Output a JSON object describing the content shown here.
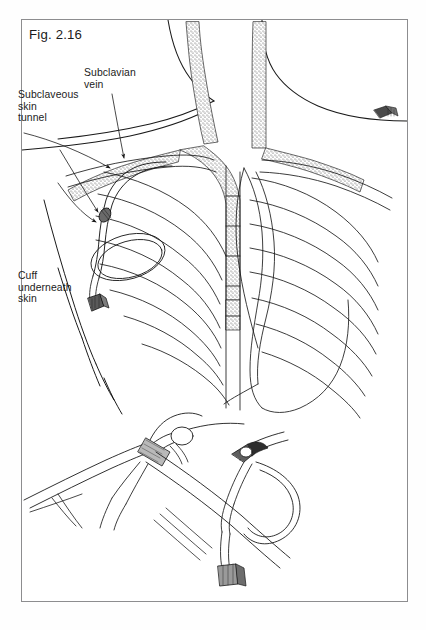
{
  "figure": {
    "number": "Fig. 2.16",
    "frame": {
      "border_color": "#8d8d8f",
      "background": "#ffffff"
    },
    "ink_color": "#1a1a1a",
    "stipple_color": "#555555"
  },
  "labels": [
    {
      "id": "subclavian-vein",
      "text": "Subclavian\nvein"
    },
    {
      "id": "subclaveous-skin-tunnel",
      "text": "Subclaveous\nskin\ntunnel"
    },
    {
      "id": "cuff-underneath-skin",
      "text": "Cuff\nunderneath\nskin"
    }
  ],
  "anatomy": {
    "main_view": "anterior chest and neck with rib cage, sternum, heart silhouette and stippled subclavian and jugular veins",
    "structures": [
      "neck contour",
      "clavicle",
      "rib cage",
      "sternum",
      "heart outline",
      "subclavian vein (stippled)",
      "internal jugular veins (stippled)",
      "tunneled catheter",
      "catheter cuff",
      "catheter connector hub",
      "coiled catheter loop"
    ]
  },
  "insets": [
    {
      "id": "inset-left",
      "description": "close-up of tunneling instrument grasping catheter beneath skin"
    },
    {
      "id": "inset-right",
      "description": "close-up of catheter exit site with coiled loop and connector hub"
    }
  ]
}
